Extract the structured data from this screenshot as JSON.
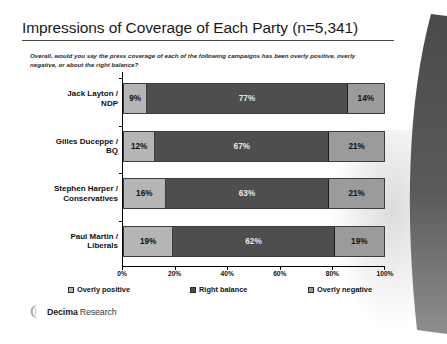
{
  "slide": {
    "title": "Impressions of Coverage of Each Party (n=5,341)",
    "question": "Overall, would you say the press coverage of each of the following campaigns has been overly positive, overly negative, or about the right balance?"
  },
  "footer": {
    "brand_name": "Decima",
    "brand_suffix": "Research",
    "logo_icon": "decima-crescent-logo-icon"
  },
  "legend": {
    "items": [
      {
        "label": "Overly positive",
        "color": "#b5b5b5"
      },
      {
        "label": "Right balance",
        "color": "#4e4e4e"
      },
      {
        "label": "Overly negative",
        "color": "#9b9b9b"
      }
    ]
  },
  "chart_data": {
    "type": "bar",
    "orientation": "horizontal",
    "stacked": true,
    "title": "Impressions of Coverage of Each Party (n=5,341)",
    "subtitle": "Overall, would you say the press coverage of each of the following campaigns has been overly positive, overly negative, or about the right balance?",
    "xlabel": "",
    "ylabel": "",
    "xlim": [
      0,
      100
    ],
    "grid": false,
    "legend_position": "bottom",
    "xticks": [
      0,
      20,
      40,
      60,
      80,
      100
    ],
    "xtick_labels": [
      "0%",
      "20%",
      "40%",
      "60%",
      "80%",
      "100%"
    ],
    "categories": [
      "Jack Layton / NDP",
      "Gilles Duceppe / BQ",
      "Stephen Harper / Conservatives",
      "Paul Martin / Liberals"
    ],
    "category_lines": [
      [
        "Jack Layton /",
        "NDP"
      ],
      [
        "Gilles Duceppe /",
        "BQ"
      ],
      [
        "Stephen Harper /",
        "Conservatives"
      ],
      [
        "Paul Martin /",
        "Liberals"
      ]
    ],
    "series": [
      {
        "name": "Overly positive",
        "color": "#b5b5b5",
        "values": [
          9,
          12,
          16,
          19
        ],
        "labels": [
          "9%",
          "12%",
          "16%",
          "19%"
        ]
      },
      {
        "name": "Right balance",
        "color": "#4e4e4e",
        "values": [
          77,
          67,
          63,
          62
        ],
        "labels": [
          "77%",
          "67%",
          "63%",
          "62%"
        ]
      },
      {
        "name": "Overly negative",
        "color": "#9b9b9b",
        "values": [
          14,
          21,
          21,
          19
        ],
        "labels": [
          "14%",
          "21%",
          "21%",
          "19%"
        ]
      }
    ]
  }
}
